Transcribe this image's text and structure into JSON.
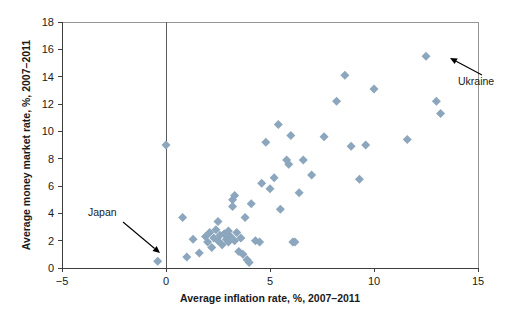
{
  "chart_data": {
    "type": "scatter",
    "title": "",
    "xlabel": "Average inflation rate, %, 2007–2011",
    "ylabel": "Average money market rate, %, 2007–2011",
    "xlim": [
      -5,
      15
    ],
    "ylim": [
      0,
      18
    ],
    "xticks": [
      -5,
      0,
      5,
      10,
      15
    ],
    "xtick_labels": [
      "−5",
      "0",
      "5",
      "10",
      "15"
    ],
    "yticks": [
      0,
      2,
      4,
      6,
      8,
      10,
      12,
      14,
      16,
      18
    ],
    "ytick_labels": [
      "0",
      "2",
      "4",
      "6",
      "8",
      "10",
      "12",
      "14",
      "16",
      "18"
    ],
    "grid": false,
    "legend": null,
    "marker": {
      "shape": "diamond",
      "color": "#8ba6bd",
      "size": 9
    },
    "series": [
      {
        "name": "Countries",
        "points": [
          [
            -0.4,
            0.5
          ],
          [
            0.0,
            9.0
          ],
          [
            0.8,
            3.7
          ],
          [
            1.0,
            0.8
          ],
          [
            1.3,
            2.1
          ],
          [
            1.6,
            1.1
          ],
          [
            1.9,
            2.3
          ],
          [
            2.0,
            1.9
          ],
          [
            2.1,
            2.6
          ],
          [
            2.2,
            1.5
          ],
          [
            2.3,
            2.2
          ],
          [
            2.4,
            2.8
          ],
          [
            2.5,
            2.0
          ],
          [
            2.5,
            3.4
          ],
          [
            2.6,
            2.4
          ],
          [
            2.7,
            1.7
          ],
          [
            2.8,
            2.5
          ],
          [
            2.9,
            2.1
          ],
          [
            3.0,
            2.7
          ],
          [
            3.0,
            1.9
          ],
          [
            3.1,
            2.3
          ],
          [
            3.2,
            4.5
          ],
          [
            3.2,
            5.0
          ],
          [
            3.3,
            5.3
          ],
          [
            3.3,
            2.0
          ],
          [
            3.4,
            2.6
          ],
          [
            3.5,
            1.2
          ],
          [
            3.6,
            2.2
          ],
          [
            3.7,
            1.0
          ],
          [
            3.8,
            3.7
          ],
          [
            3.9,
            0.6
          ],
          [
            4.0,
            0.4
          ],
          [
            4.1,
            4.7
          ],
          [
            4.3,
            2.0
          ],
          [
            4.5,
            1.9
          ],
          [
            4.6,
            6.2
          ],
          [
            4.8,
            9.2
          ],
          [
            5.0,
            5.8
          ],
          [
            5.2,
            6.6
          ],
          [
            5.4,
            10.5
          ],
          [
            5.5,
            4.3
          ],
          [
            5.8,
            7.9
          ],
          [
            5.9,
            7.6
          ],
          [
            6.0,
            9.7
          ],
          [
            6.1,
            1.9
          ],
          [
            6.2,
            1.9
          ],
          [
            6.4,
            5.5
          ],
          [
            6.6,
            7.9
          ],
          [
            7.0,
            6.8
          ],
          [
            7.6,
            9.6
          ],
          [
            8.2,
            12.2
          ],
          [
            8.6,
            14.1
          ],
          [
            8.9,
            8.9
          ],
          [
            9.3,
            6.5
          ],
          [
            9.6,
            9.0
          ],
          [
            10.0,
            13.1
          ],
          [
            11.6,
            9.4
          ],
          [
            12.5,
            15.5
          ],
          [
            13.0,
            12.2
          ],
          [
            13.2,
            11.3
          ]
        ]
      }
    ],
    "annotations": [
      {
        "label": "Japan",
        "point": [
          -0.4,
          0.5
        ],
        "label_x": 88,
        "label_y": 216,
        "arrow_from_x": 123,
        "arrow_from_y": 222,
        "arrow_to_x": 160,
        "arrow_to_y": 253
      },
      {
        "label": "Ukraine",
        "point": [
          12.5,
          15.5
        ],
        "label_x": 458,
        "label_y": 85,
        "arrow_from_x": 482,
        "arrow_from_y": 75,
        "arrow_to_x": 450,
        "arrow_to_y": 58
      }
    ]
  }
}
